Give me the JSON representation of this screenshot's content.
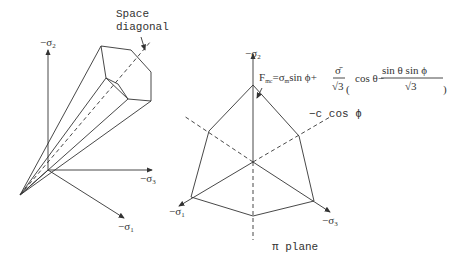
{
  "left_figure": {
    "annotation_line1": "Space",
    "annotation_line2": "diagonal",
    "axis_sigma2": "−σ",
    "axis_sigma2_sub": "2",
    "axis_sigma3": "−σ",
    "axis_sigma3_sub": "3",
    "axis_sigma1": "−σ",
    "axis_sigma1_sub": "1"
  },
  "right_figure": {
    "axis_sigma2": "−σ",
    "axis_sigma2_sub": "2",
    "axis_sigma1": "−σ",
    "axis_sigma1_sub": "1",
    "axis_sigma3": "−σ",
    "axis_sigma3_sub": "3",
    "formula_lhs": "F",
    "formula_lhs_sub": "mc",
    "formula_eq": "=σ",
    "formula_sub_m": "m",
    "formula_part1": "sin ϕ+",
    "formula_frac_num": "σ̄",
    "formula_frac_den": "√3",
    "formula_cos": "cos θ−",
    "formula_frac2_num": "sin θ sin ϕ",
    "formula_frac2_den": "√3",
    "offset_label": "−c cos ϕ",
    "plane_label": "π plane"
  }
}
